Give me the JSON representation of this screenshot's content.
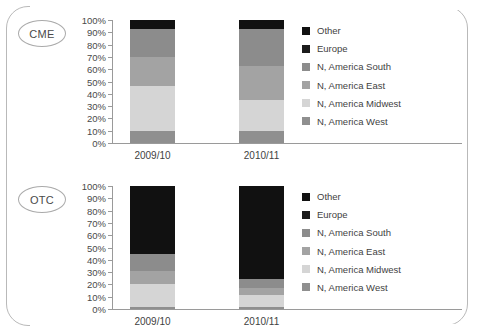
{
  "figure": {
    "panels": [
      {
        "badge": "CME",
        "x_labels": [
          "2009/10",
          "2010/11"
        ],
        "y_ticks": [
          "100%",
          "90%",
          "80%",
          "70%",
          "60%",
          "50%",
          "40%",
          "30%",
          "20%",
          "10%",
          "0%"
        ]
      },
      {
        "badge": "OTC",
        "x_labels": [
          "2009/10",
          "2010/11"
        ],
        "y_ticks": [
          "100%",
          "90%",
          "80%",
          "70%",
          "60%",
          "50%",
          "40%",
          "30%",
          "20%",
          "10%",
          "0%"
        ]
      }
    ],
    "legend": {
      "items": [
        {
          "label": "Other",
          "color": "#111111"
        },
        {
          "label": "Europe",
          "color": "#1c1c1c"
        },
        {
          "label": "N, America South",
          "color": "#8c8c8c"
        },
        {
          "label": "N, America East",
          "color": "#a3a3a3"
        },
        {
          "label": "N, America Midwest",
          "color": "#d5d5d5"
        },
        {
          "label": "N, America West",
          "color": "#8f8f8f"
        }
      ]
    }
  },
  "chart_data": [
    {
      "type": "bar",
      "title": "CME",
      "stacked": true,
      "normalized": true,
      "xlabel": "",
      "ylabel": "",
      "ylim": [
        0,
        100
      ],
      "grid": false,
      "legend_position": "right",
      "categories": [
        "2009/10",
        "2010/11"
      ],
      "series": [
        {
          "name": "N, America West",
          "color": "#8f8f8f",
          "values": [
            10,
            10
          ]
        },
        {
          "name": "N, America Midwest",
          "color": "#d5d5d5",
          "values": [
            36,
            25
          ]
        },
        {
          "name": "N, America East",
          "color": "#a3a3a3",
          "values": [
            24,
            28
          ]
        },
        {
          "name": "N, America South",
          "color": "#8c8c8c",
          "values": [
            23,
            30
          ]
        },
        {
          "name": "Europe",
          "color": "#1c1c1c",
          "values": [
            0,
            0
          ]
        },
        {
          "name": "Other",
          "color": "#111111",
          "values": [
            7,
            7
          ]
        }
      ],
      "cumulative_boundaries": {
        "2009/10": [
          0,
          10,
          46,
          70,
          93,
          93,
          100
        ],
        "2010/11": [
          0,
          10,
          35,
          63,
          93,
          93,
          100
        ]
      }
    },
    {
      "type": "bar",
      "title": "OTC",
      "stacked": true,
      "normalized": true,
      "xlabel": "",
      "ylabel": "",
      "ylim": [
        0,
        100
      ],
      "grid": false,
      "legend_position": "right",
      "categories": [
        "2009/10",
        "2010/11"
      ],
      "series": [
        {
          "name": "N, America West",
          "color": "#8f8f8f",
          "values": [
            2,
            2
          ]
        },
        {
          "name": "N, America Midwest",
          "color": "#d5d5d5",
          "values": [
            18,
            9
          ]
        },
        {
          "name": "N, America East",
          "color": "#a3a3a3",
          "values": [
            11,
            6
          ]
        },
        {
          "name": "N, America South",
          "color": "#8c8c8c",
          "values": [
            14,
            7
          ]
        },
        {
          "name": "Europe",
          "color": "#1c1c1c",
          "values": [
            0,
            0
          ]
        },
        {
          "name": "Other",
          "color": "#111111",
          "values": [
            55,
            76
          ]
        }
      ],
      "cumulative_boundaries": {
        "2009/10": [
          0,
          2,
          20,
          31,
          45,
          45,
          100
        ],
        "2010/11": [
          0,
          2,
          11,
          17,
          24,
          24,
          100
        ]
      }
    }
  ]
}
